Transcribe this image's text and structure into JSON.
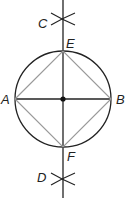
{
  "diagram": {
    "colors": {
      "circle": "#222222",
      "axes": "#222222",
      "square": "#9a9a9a",
      "center_dot": "#111111",
      "background": "#ffffff"
    },
    "center": {
      "x": 63,
      "y": 99
    },
    "radius": 48,
    "points": [
      {
        "id": "A",
        "label": "A",
        "x": 15,
        "y": 99,
        "label_x": 1,
        "label_y": 104
      },
      {
        "id": "B",
        "label": "B",
        "x": 111,
        "y": 99,
        "label_x": 116,
        "label_y": 104
      },
      {
        "id": "E",
        "label": "E",
        "x": 63,
        "y": 51,
        "label_x": 66,
        "label_y": 48
      },
      {
        "id": "F",
        "label": "F",
        "x": 63,
        "y": 147,
        "label_x": 67,
        "label_y": 161
      },
      {
        "id": "C",
        "label": "C",
        "x": 63,
        "y": 19,
        "label_x": 38,
        "label_y": 28
      },
      {
        "id": "D",
        "label": "D",
        "x": 63,
        "y": 179,
        "label_x": 37,
        "label_y": 182
      }
    ],
    "lines": [
      {
        "name": "vertical-bisector",
        "from": "top",
        "to": "bottom"
      },
      {
        "name": "diameter-AB",
        "from": "A",
        "to": "B"
      }
    ],
    "square": [
      "A",
      "E",
      "B",
      "F"
    ]
  }
}
